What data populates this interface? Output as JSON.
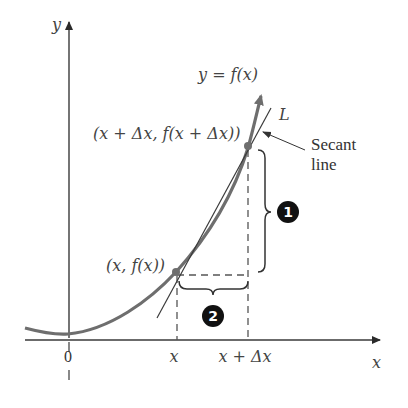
{
  "figure": {
    "colors": {
      "axis": "#3a3a3a",
      "curve": "#6e6e6e",
      "secant": "#3a3a3a",
      "dashed": "#555555",
      "badge": "#111111",
      "text": "#444444"
    },
    "axes": {
      "x_label": "x",
      "y_label": "y",
      "origin_label": "0",
      "x_ticks": [
        "0",
        "x",
        "x + Δx"
      ]
    },
    "curve": {
      "label": "y = f(x)"
    },
    "secant": {
      "label": "L",
      "callout": [
        "Secant",
        "line"
      ]
    },
    "points": [
      {
        "id": "p1",
        "label": "(x, f(x))"
      },
      {
        "id": "p2",
        "label": "(x + Δx, f(x + Δx))"
      }
    ],
    "braces": [
      {
        "id": "rise",
        "badge": "1",
        "meaning": "vertical change"
      },
      {
        "id": "run",
        "badge": "2",
        "meaning": "horizontal change"
      }
    ]
  }
}
